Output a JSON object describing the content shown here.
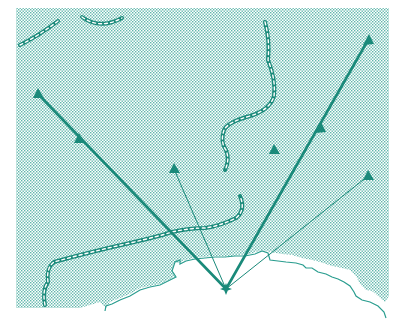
{
  "map": {
    "title": "Radial lines from coastal point",
    "colors": {
      "stroke": "#1a8a7a",
      "stipple": "#2a9d8f",
      "background": "#ffffff"
    },
    "origin": {
      "x": 226,
      "y": 289
    },
    "rays": [
      {
        "id": "ray-1",
        "to": {
          "x": 38,
          "y": 94
        },
        "weight": "thick",
        "arrow_mid": {
          "x": 80,
          "y": 139
        }
      },
      {
        "id": "ray-2",
        "to": {
          "x": 174,
          "y": 169
        },
        "weight": "thin"
      },
      {
        "id": "ray-3",
        "to": {
          "x": 368,
          "y": 40
        },
        "weight": "thick",
        "arrow_mid": {
          "x": 320,
          "y": 128
        }
      },
      {
        "id": "ray-4",
        "to": {
          "x": 368,
          "y": 176
        },
        "weight": "thin"
      }
    ],
    "markers": [
      {
        "id": "marker-isolated",
        "x": 274,
        "y": 149
      }
    ]
  }
}
